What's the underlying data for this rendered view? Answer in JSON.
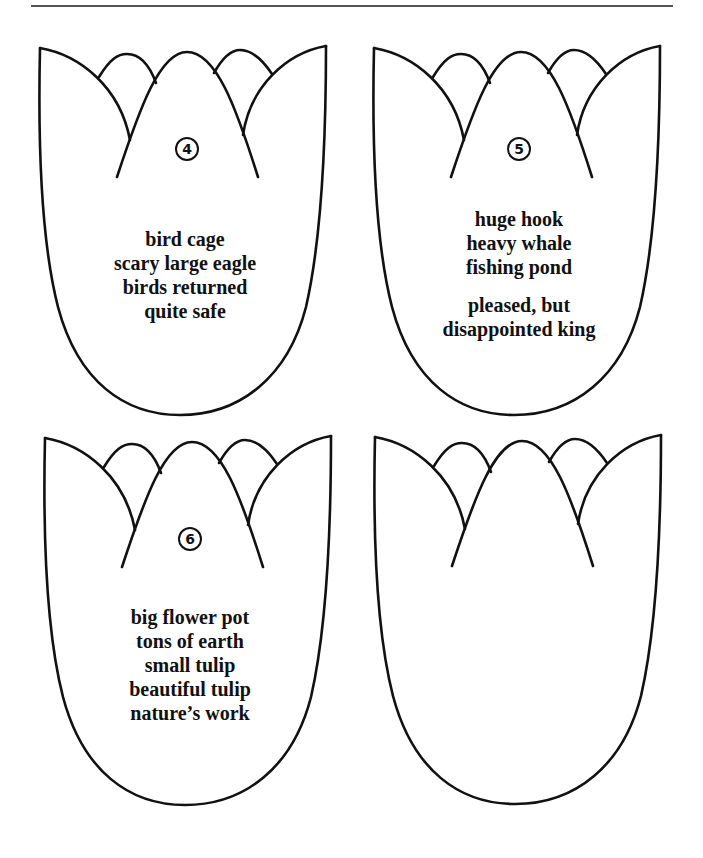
{
  "page": {
    "colors": {
      "line": "#111111",
      "rule": "#555555",
      "background": "#ffffff"
    }
  },
  "tulips": [
    {
      "position": "top-left",
      "number": "4",
      "number_glyph": "circled-number",
      "groups": [
        [
          "bird cage",
          "scary large eagle",
          "birds returned",
          "quite safe"
        ]
      ]
    },
    {
      "position": "top-right",
      "number": "5",
      "number_glyph": "circled-number",
      "groups": [
        [
          "huge hook",
          "heavy whale",
          "fishing pond"
        ],
        [
          "pleased, but",
          "disappointed king"
        ]
      ]
    },
    {
      "position": "bottom-left",
      "number": "6",
      "number_glyph": "circled-number",
      "groups": [
        [
          "big flower pot",
          "tons of earth",
          "small tulip",
          "beautiful tulip",
          "nature’s work"
        ]
      ]
    },
    {
      "position": "bottom-right",
      "number": "",
      "groups": []
    }
  ]
}
